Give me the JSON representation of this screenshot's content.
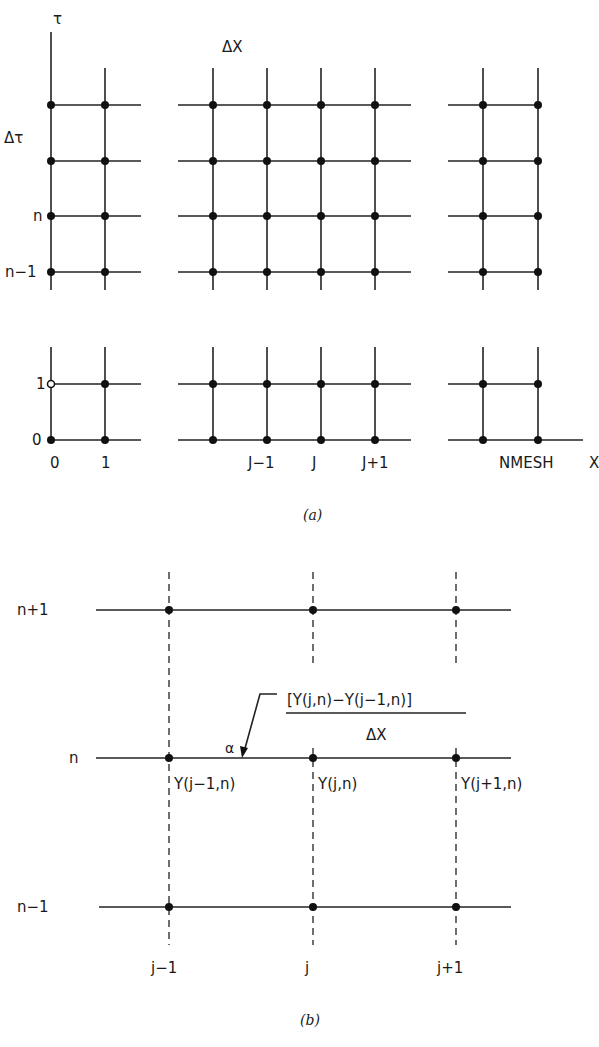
{
  "figure_a": {
    "caption": "(a)",
    "axis_labels": {
      "time_axis": "τ",
      "space_axis": "X"
    },
    "spacing_labels": {
      "dx": "ΔX",
      "dt": "Δτ"
    },
    "row_labels": {
      "n": "n",
      "n_minus_1": "n−1",
      "one": "1",
      "zero": "0"
    },
    "column_labels": {
      "zero": "0",
      "one": "1",
      "j_minus_1": "J−1",
      "j": "J",
      "j_plus_1": "J+1",
      "nmesh": "NMESH"
    }
  },
  "figure_b": {
    "caption": "(b)",
    "row_labels": {
      "n_plus_1": "n+1",
      "n": "n",
      "n_minus_1": "n−1"
    },
    "column_labels": {
      "j_minus_1": "j−1",
      "j": "j",
      "j_plus_1": "j+1"
    },
    "node_labels": {
      "y_jm1_n": "Y(j−1,n)",
      "y_j_n": "Y(j,n)",
      "y_jp1_n": "Y(j+1,n)"
    },
    "alpha_label": "α",
    "slope_formula": {
      "numerator": "[Y(j,n)−Y(j−1,n)]",
      "denominator": "ΔX"
    }
  }
}
